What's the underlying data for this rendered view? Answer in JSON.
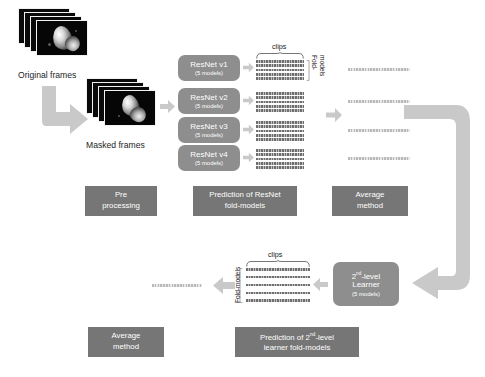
{
  "diagram": {
    "colors": {
      "model_box": "#8e8e8e",
      "caption_box": "#767676",
      "arrow": "#c9c9c9",
      "grid_row": "#6e6e6e",
      "avg_bar": "#b9b9b9",
      "background": "#ffffff"
    },
    "inputs": [
      {
        "label": "Original frames",
        "frame_count": 4,
        "kind": "echocardiogram-frame-stack"
      },
      {
        "label": "Masked frames",
        "frame_count": 4,
        "kind": "masked-echocardiogram-frame-stack"
      }
    ],
    "models": [
      {
        "name": "ResNet v1",
        "sub": "(5 models)"
      },
      {
        "name": "ResNet v2",
        "sub": "(5 models)"
      },
      {
        "name": "ResNet v3",
        "sub": "(5 models)"
      },
      {
        "name": "ResNet v4",
        "sub": "(5 models)"
      }
    ],
    "second_level": {
      "name_prefix": "2",
      "name_sup": "nd",
      "name_suffix": "-level",
      "name_line2": "Learner",
      "sub": "(5 models)"
    },
    "axis_labels": {
      "clips": "clips",
      "fold_models_top": "Fold-\nmodels",
      "fold_models_top_line1": "Fold-",
      "fold_models_top_line2": "models",
      "fold_models_bottom": "Fold-models"
    },
    "grids": {
      "top_rows_per_grid": 5,
      "top_grid_count": 4,
      "bottom_rows": 5,
      "avg_bars_top": 4,
      "avg_bars_bottom": 1
    },
    "captions": [
      {
        "id": "pre-processing",
        "line1": "Pre",
        "line2": "processing"
      },
      {
        "id": "prediction-resnet",
        "line1": "Prediction of ResNet",
        "line2": "fold-models"
      },
      {
        "id": "average-method-top",
        "line1": "Average",
        "line2": "method"
      },
      {
        "id": "average-method-bottom",
        "line1": "Average",
        "line2": "method"
      },
      {
        "id": "prediction-second-level",
        "line1_pre": "Prediction of 2",
        "line1_sup": "nd",
        "line1_post": "-level",
        "line2": "learner fold-models"
      }
    ],
    "arrows": [
      {
        "id": "preprocess-elbow",
        "shape": "down-then-right"
      },
      {
        "id": "masked-to-models",
        "shape": "right"
      },
      {
        "id": "model-to-grid",
        "shape": "right",
        "count": 4
      },
      {
        "id": "grid-to-average",
        "shape": "right"
      },
      {
        "id": "average-to-second-level",
        "shape": "right-down-left-elbow"
      },
      {
        "id": "second-level-to-grid",
        "shape": "left"
      },
      {
        "id": "grid-to-average-bottom",
        "shape": "left"
      }
    ]
  }
}
